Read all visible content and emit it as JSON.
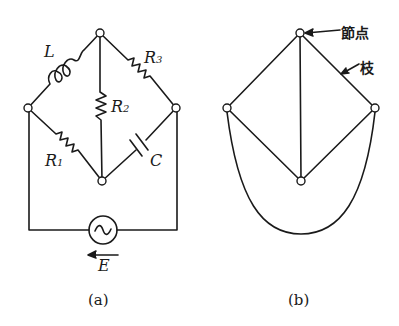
{
  "figure_a": {
    "caption": "(a)",
    "components": {
      "inductor": {
        "label": "L"
      },
      "r1": {
        "label": "R",
        "sub": "1"
      },
      "r2": {
        "label": "R",
        "sub": "2"
      },
      "r3": {
        "label": "R",
        "sub": "3"
      },
      "capacitor": {
        "label": "C"
      },
      "source": {
        "label": "E",
        "symbol": "~"
      }
    }
  },
  "figure_b": {
    "caption": "(b)",
    "annotations": {
      "node_label": "節点",
      "branch_label": "枝"
    }
  },
  "colors": {
    "ink": "#1a1a1a",
    "background": "#ffffff"
  }
}
